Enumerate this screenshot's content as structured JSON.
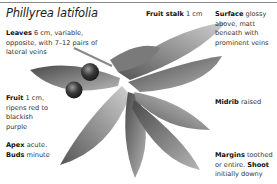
{
  "title": "Phillyrea latifolia",
  "annotations": {
    "fruit_stalk": {
      "term": "Fruit stalk",
      "text": " 1 cm"
    },
    "leaves": {
      "term": "Leaves",
      "text": " 6 cm, variable, opposite, with 7–12 pairs of lateral veins"
    },
    "surface": {
      "term": "Surface",
      "text": " glossy above, matt beneath with prominent veins"
    },
    "fruit": {
      "term": "Fruit",
      "text": " 1 cm, ripens red to blackish purple"
    },
    "midrib": {
      "term": "Midrib",
      "text": " raised"
    },
    "apex": {
      "term": "Apex",
      "text": " acute. "
    },
    "buds": {
      "term": "Buds",
      "text": " minute"
    },
    "margins": {
      "term": "Margins",
      "text": " toothed or entire. "
    },
    "shoot": {
      "term": "Shoot",
      "text": " initially downy"
    }
  },
  "colors": {
    "rule": "#888888",
    "leaf_dark": "#5a5a5a",
    "leaf_light": "#c8c8c8",
    "berry": "#3a3a3a"
  }
}
